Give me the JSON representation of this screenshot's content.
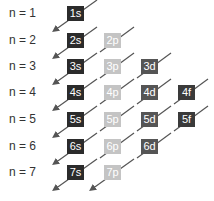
{
  "colors": {
    "s": "#2b2b2b",
    "p": "#c4c4c4",
    "d": "#555555",
    "f": "#3a3a3a",
    "arrow": "#555555"
  },
  "rows": [
    {
      "n_label": "n = 1",
      "orbitals": [
        "1s"
      ]
    },
    {
      "n_label": "n = 2",
      "orbitals": [
        "2s",
        "2p"
      ]
    },
    {
      "n_label": "n = 3",
      "orbitals": [
        "3s",
        "3p",
        "3d"
      ]
    },
    {
      "n_label": "n = 4",
      "orbitals": [
        "4s",
        "4p",
        "4d",
        "4f"
      ]
    },
    {
      "n_label": "n = 5",
      "orbitals": [
        "5s",
        "5p",
        "5d",
        "5f"
      ]
    },
    {
      "n_label": "n = 6",
      "orbitals": [
        "6s",
        "6p",
        "6d"
      ]
    },
    {
      "n_label": "n = 7",
      "orbitals": [
        "7s",
        "7p"
      ]
    }
  ]
}
